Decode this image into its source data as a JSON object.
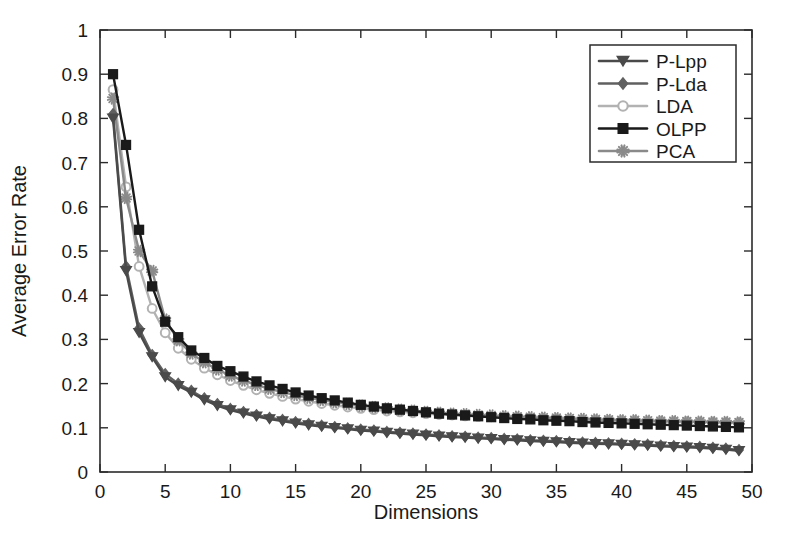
{
  "chart_data": {
    "type": "line",
    "title": "",
    "xlabel": "Dimensions",
    "ylabel": "Average Error Rate",
    "xlim": [
      0,
      50
    ],
    "ylim": [
      0,
      1
    ],
    "xticks": [
      0,
      5,
      10,
      15,
      20,
      25,
      30,
      35,
      40,
      45,
      50
    ],
    "xtick_labels": [
      "0",
      "5",
      "10",
      "15",
      "20",
      "25",
      "30",
      "35",
      "40",
      "45",
      "50"
    ],
    "yticks": [
      0,
      0.1,
      0.2,
      0.3,
      0.4,
      0.5,
      0.6,
      0.7,
      0.8,
      0.9,
      1
    ],
    "ytick_labels": [
      "0",
      "0.1",
      "0.2",
      "0.3",
      "0.4",
      "0.5",
      "0.6",
      "0.7",
      "0.8",
      "0.9",
      "1"
    ],
    "grid": false,
    "legend_position": "upper-right",
    "x": [
      1,
      2,
      3,
      4,
      5,
      6,
      7,
      8,
      9,
      10,
      11,
      12,
      13,
      14,
      15,
      16,
      17,
      18,
      19,
      20,
      21,
      22,
      23,
      24,
      25,
      26,
      27,
      28,
      29,
      30,
      31,
      32,
      33,
      34,
      35,
      36,
      37,
      38,
      39,
      40,
      41,
      42,
      43,
      44,
      45,
      46,
      47,
      48,
      49
    ],
    "series": [
      {
        "name": "P-Lpp",
        "color": "#4a4a4a",
        "marker": "triangle-down",
        "values": [
          0.8,
          0.455,
          0.315,
          0.26,
          0.215,
          0.195,
          0.18,
          0.163,
          0.15,
          0.14,
          0.133,
          0.126,
          0.12,
          0.115,
          0.11,
          0.106,
          0.103,
          0.1,
          0.097,
          0.094,
          0.092,
          0.089,
          0.087,
          0.085,
          0.083,
          0.081,
          0.079,
          0.078,
          0.076,
          0.075,
          0.073,
          0.072,
          0.07,
          0.069,
          0.068,
          0.066,
          0.065,
          0.064,
          0.063,
          0.062,
          0.061,
          0.06,
          0.058,
          0.057,
          0.056,
          0.055,
          0.053,
          0.051,
          0.048
        ]
      },
      {
        "name": "P-Lda",
        "color": "#606060",
        "marker": "diamond",
        "values": [
          0.81,
          0.465,
          0.325,
          0.265,
          0.222,
          0.2,
          0.184,
          0.167,
          0.154,
          0.143,
          0.136,
          0.129,
          0.123,
          0.118,
          0.113,
          0.109,
          0.105,
          0.102,
          0.099,
          0.096,
          0.094,
          0.091,
          0.089,
          0.087,
          0.085,
          0.083,
          0.081,
          0.08,
          0.078,
          0.077,
          0.075,
          0.074,
          0.072,
          0.071,
          0.07,
          0.068,
          0.067,
          0.066,
          0.065,
          0.064,
          0.063,
          0.062,
          0.06,
          0.059,
          0.058,
          0.057,
          0.055,
          0.053,
          0.05
        ]
      },
      {
        "name": "LDA",
        "color": "#b2b2b2",
        "marker": "circle",
        "values": [
          0.865,
          0.645,
          0.465,
          0.37,
          0.315,
          0.28,
          0.255,
          0.235,
          0.22,
          0.207,
          0.196,
          0.186,
          0.178,
          0.171,
          0.165,
          0.16,
          0.155,
          0.151,
          0.147,
          0.144,
          0.141,
          0.138,
          0.136,
          0.134,
          0.132,
          0.13,
          0.129,
          0.127,
          0.126,
          0.125,
          0.124,
          0.123,
          0.122,
          0.121,
          0.12,
          0.119,
          0.118,
          0.118,
          0.117,
          0.116,
          0.116,
          0.115,
          0.115,
          0.114,
          0.114,
          0.113,
          0.113,
          0.112,
          0.112
        ]
      },
      {
        "name": "OLPP",
        "color": "#1a1a1a",
        "marker": "square",
        "values": [
          0.9,
          0.74,
          0.548,
          0.42,
          0.34,
          0.305,
          0.275,
          0.258,
          0.24,
          0.228,
          0.216,
          0.205,
          0.196,
          0.188,
          0.18,
          0.173,
          0.167,
          0.162,
          0.157,
          0.152,
          0.148,
          0.144,
          0.141,
          0.138,
          0.135,
          0.132,
          0.13,
          0.128,
          0.126,
          0.124,
          0.122,
          0.12,
          0.119,
          0.117,
          0.116,
          0.115,
          0.113,
          0.112,
          0.111,
          0.11,
          0.109,
          0.108,
          0.107,
          0.106,
          0.105,
          0.104,
          0.103,
          0.102,
          0.101
        ]
      },
      {
        "name": "PCA",
        "color": "#8a8a8a",
        "marker": "asterisk",
        "values": [
          0.845,
          0.62,
          0.5,
          0.455,
          0.345,
          0.298,
          0.268,
          0.248,
          0.232,
          0.218,
          0.207,
          0.197,
          0.188,
          0.181,
          0.174,
          0.168,
          0.163,
          0.158,
          0.154,
          0.15,
          0.147,
          0.144,
          0.141,
          0.139,
          0.136,
          0.134,
          0.132,
          0.131,
          0.129,
          0.128,
          0.126,
          0.125,
          0.124,
          0.123,
          0.122,
          0.121,
          0.12,
          0.119,
          0.118,
          0.117,
          0.117,
          0.116,
          0.115,
          0.115,
          0.114,
          0.114,
          0.113,
          0.113,
          0.112
        ]
      }
    ],
    "legend": [
      "P-Lpp",
      "P-Lda",
      "LDA",
      "OLPP",
      "PCA"
    ]
  }
}
